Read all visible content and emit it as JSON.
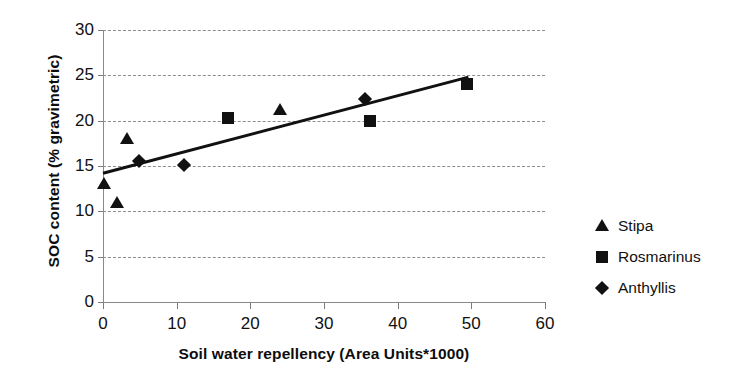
{
  "chart_data": {
    "type": "scatter",
    "title": "",
    "xlabel": "Soil water repellency (Area Units*1000)",
    "ylabel": "SOC content (% gravimetric)",
    "xlim": [
      0,
      60
    ],
    "ylim": [
      0,
      30
    ],
    "xticks": [
      0,
      10,
      20,
      30,
      40,
      50,
      60
    ],
    "yticks": [
      0,
      5,
      10,
      15,
      20,
      25,
      30
    ],
    "grid": "horizontal-dashed",
    "legend_position": "right",
    "series": [
      {
        "name": "Stipa",
        "marker": "triangle",
        "color": "#111111",
        "points": [
          {
            "x": 0.2,
            "y": 13.0
          },
          {
            "x": 1.9,
            "y": 10.9
          },
          {
            "x": 3.2,
            "y": 18.0
          },
          {
            "x": 24.0,
            "y": 21.2
          }
        ]
      },
      {
        "name": "Rosmarinus",
        "marker": "square",
        "color": "#111111",
        "points": [
          {
            "x": 17.0,
            "y": 20.3
          },
          {
            "x": 36.3,
            "y": 20.0
          },
          {
            "x": 49.4,
            "y": 24.0
          }
        ]
      },
      {
        "name": "Anthyllis",
        "marker": "diamond",
        "color": "#111111",
        "points": [
          {
            "x": 4.9,
            "y": 15.5
          },
          {
            "x": 11.0,
            "y": 15.1
          },
          {
            "x": 35.6,
            "y": 22.4
          }
        ]
      }
    ],
    "trendline": {
      "type": "linear",
      "from": {
        "x": 0.0,
        "y": 14.2
      },
      "to": {
        "x": 49.6,
        "y": 24.8
      },
      "color": "#111111",
      "width": 3
    }
  },
  "axes": {
    "y_tick_labels": [
      "0",
      "5",
      "10",
      "15",
      "20",
      "25",
      "30"
    ],
    "x_tick_labels": [
      "0",
      "10",
      "20",
      "30",
      "40",
      "50",
      "60"
    ],
    "y_title": "SOC content (% gravimetric)",
    "x_title": "Soil water repellency (Area Units*1000)"
  },
  "legend": {
    "items": [
      {
        "label": "Stipa",
        "marker": "triangle"
      },
      {
        "label": "Rosmarinus",
        "marker": "square"
      },
      {
        "label": "Anthyllis",
        "marker": "diamond"
      }
    ]
  },
  "colors": {
    "ink": "#111111",
    "grid": "#8d8d8d",
    "axis": "#8a8a8a",
    "background": "#ffffff"
  }
}
